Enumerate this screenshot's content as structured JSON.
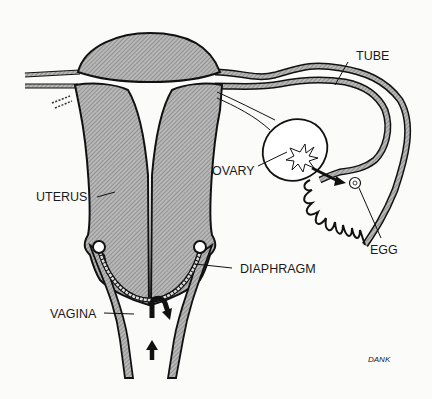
{
  "diagram": {
    "type": "anatomical illustration",
    "labels": {
      "tube": "TUBE",
      "ovary": "OVARY",
      "uterus": "UTERUS",
      "egg": "EGG",
      "diaphragm": "DIAPHRAGM",
      "vagina": "VAGINA"
    },
    "signature": "DANK",
    "colors": {
      "background": "#fbfbfa",
      "tissue_fill": "#a9a9a9",
      "outline": "#111111"
    }
  }
}
